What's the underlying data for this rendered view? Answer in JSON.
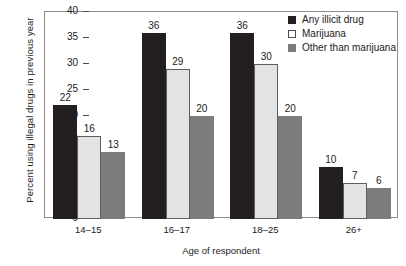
{
  "chart_data": {
    "type": "bar",
    "title": "",
    "xlabel": "Age of respondent",
    "ylabel": "Percent using illegal drugs in previous year",
    "categories": [
      "14–15",
      "16–17",
      "18–25",
      "26+"
    ],
    "series": [
      {
        "name": "Any illicit drug",
        "values": [
          22,
          36,
          36,
          10
        ],
        "color": "#231f20"
      },
      {
        "name": "Marijuana",
        "values": [
          16,
          29,
          30,
          7
        ],
        "color": "#e3e3e3"
      },
      {
        "name": "Other than marijuana",
        "values": [
          13,
          20,
          20,
          6
        ],
        "color": "#7c7c7c"
      }
    ],
    "ylim": [
      0,
      40
    ],
    "yticks": [
      0,
      5,
      10,
      15,
      20,
      25,
      30,
      35,
      40
    ],
    "ytick_labels": [
      "0",
      "5",
      "10",
      "15",
      "20",
      "25",
      "30",
      "35",
      "40"
    ],
    "grid": false,
    "legend_position": "top-right",
    "show_value_labels": true
  },
  "legend": {
    "entries": [
      {
        "label": "Any illicit drug"
      },
      {
        "label": "Marijuana"
      },
      {
        "label": "Other than marijuana"
      }
    ]
  }
}
